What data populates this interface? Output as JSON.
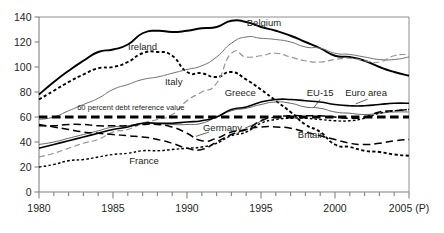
{
  "chart_data": {
    "type": "line",
    "title": "",
    "subtitle": "",
    "xlabel": "",
    "ylabel": "",
    "xlim": [
      1980,
      2005
    ],
    "ylim": [
      0,
      140
    ],
    "grid": false,
    "legend_position": "inline-annotations",
    "y_ticks": [
      0,
      20,
      40,
      60,
      80,
      100,
      120,
      140
    ],
    "x_ticks": [
      1980,
      1981,
      1982,
      1983,
      1984,
      1985,
      1986,
      1987,
      1988,
      1989,
      1990,
      1991,
      1992,
      1993,
      1994,
      1995,
      1996,
      1997,
      1998,
      1999,
      2000,
      2001,
      2002,
      2003,
      2004,
      2005
    ],
    "x_tick_labels": [
      "1980",
      "",
      "",
      "",
      "",
      "1985",
      "",
      "",
      "",
      "",
      "1990",
      "",
      "",
      "",
      "",
      "1995",
      "",
      "",
      "",
      "",
      "2000",
      "",
      "",
      "",
      "",
      "2005 (P)"
    ],
    "x_values": [
      1980,
      1981,
      1982,
      1983,
      1984,
      1985,
      1986,
      1987,
      1988,
      1989,
      1990,
      1991,
      1992,
      1993,
      1994,
      1995,
      1996,
      1997,
      1998,
      1999,
      2000,
      2001,
      2002,
      2003,
      2004,
      2005
    ],
    "annotations": [
      {
        "text": "60 percent debt reference value",
        "x": 1986.2,
        "y": 65.5
      },
      {
        "text": "Belgium",
        "x": 1995.2,
        "y": 133.0
      },
      {
        "text": "Ireland",
        "x": 1987.0,
        "y": 113.5
      },
      {
        "text": "Italy",
        "x": 1989.1,
        "y": 86.0
      },
      {
        "text": "Greece",
        "x": 1993.6,
        "y": 77.0
      },
      {
        "text": "EU-15",
        "x": 1999.0,
        "y": 76.5
      },
      {
        "text": "Euro area",
        "x": 2002.1,
        "y": 76.5
      },
      {
        "text": "Germany",
        "x": 1992.4,
        "y": 49.0
      },
      {
        "text": "Britain",
        "x": 1998.4,
        "y": 43.5
      },
      {
        "text": "France",
        "x": 1987.1,
        "y": 22.5
      }
    ],
    "series": [
      {
        "name": "Belgium",
        "style": "solid-thick",
        "color": "#000000",
        "values": [
          78,
          88,
          97,
          105,
          112,
          114,
          118,
          127,
          129,
          128,
          129,
          131,
          132,
          137,
          136,
          132,
          129,
          125,
          120,
          115,
          109,
          108,
          105,
          100,
          96,
          93
        ]
      },
      {
        "name": "Ireland",
        "style": "dotted-thick",
        "color": "#000000",
        "values": [
          74,
          81,
          88,
          94,
          99,
          100,
          104,
          111,
          112,
          109,
          96,
          95,
          92,
          96,
          90,
          82,
          73,
          64,
          54,
          48,
          38,
          36,
          33,
          32,
          30,
          29
        ]
      },
      {
        "name": "Italy",
        "style": "solid-thin",
        "color": "#6d6e71",
        "values": [
          58,
          60,
          65,
          70,
          75,
          82,
          86,
          90,
          92,
          95,
          98,
          101,
          108,
          119,
          124,
          123,
          122,
          120,
          116,
          115,
          111,
          110,
          108,
          106,
          106,
          108
        ]
      },
      {
        "name": "Greece",
        "style": "dashed-thin-gray",
        "color": "#939598",
        "values": [
          28,
          31,
          35,
          39,
          42,
          48,
          50,
          55,
          58,
          62,
          73,
          80,
          87,
          111,
          108,
          109,
          111,
          108,
          105,
          104,
          106,
          107,
          105,
          104,
          109,
          110
        ]
      },
      {
        "name": "EU-15",
        "style": "solid-thin-mid",
        "color": "#58595b",
        "values": [
          38,
          40,
          43,
          46,
          49,
          52,
          53,
          55,
          55,
          54,
          54,
          55,
          60,
          65,
          67,
          70,
          72,
          71,
          68,
          67,
          64,
          63,
          62,
          63,
          64,
          64
        ]
      },
      {
        "name": "Euro area",
        "style": "solid-thick-lower",
        "color": "#000000",
        "values": [
          35,
          38,
          41,
          44,
          47,
          50,
          52,
          55,
          55,
          55,
          56,
          57,
          60,
          66,
          68,
          72,
          74,
          74,
          73,
          72,
          70,
          69,
          69,
          70,
          71,
          71
        ]
      },
      {
        "name": "Germany",
        "style": "dashed-long",
        "color": "#000000",
        "values": [
          53,
          53,
          54,
          54,
          53,
          53,
          53,
          54,
          54,
          52,
          47,
          41,
          43,
          48,
          50,
          57,
          60,
          61,
          61,
          61,
          60,
          59,
          60,
          64,
          65,
          66
        ]
      },
      {
        "name": "Britain",
        "style": "dashed-long-2",
        "color": "#000000",
        "values": [
          54,
          52,
          50,
          48,
          47,
          46,
          45,
          44,
          42,
          39,
          35,
          34,
          40,
          46,
          50,
          52,
          52,
          51,
          48,
          45,
          42,
          39,
          38,
          39,
          41,
          42
        ]
      },
      {
        "name": "France",
        "style": "dotted-fine",
        "color": "#000000",
        "values": [
          20,
          22,
          25,
          26,
          28,
          30,
          31,
          33,
          33,
          34,
          35,
          36,
          39,
          45,
          48,
          55,
          58,
          59,
          59,
          58,
          57,
          57,
          59,
          63,
          65,
          66
        ]
      },
      {
        "name": "60 percent debt reference value",
        "style": "ref-line",
        "color": "#000000",
        "values": [
          60,
          60,
          60,
          60,
          60,
          60,
          60,
          60,
          60,
          60,
          60,
          60,
          60,
          60,
          60,
          60,
          60,
          60,
          60,
          60,
          60,
          60,
          60,
          60,
          60,
          60
        ]
      }
    ]
  }
}
